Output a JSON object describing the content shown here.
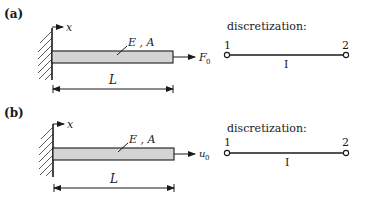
{
  "panels": [
    {
      "label": "(a)",
      "axis_label": "x",
      "material_label": "E , A",
      "length_label": "L",
      "load_symbol": "F",
      "load_subscript": "0",
      "discretization": {
        "title": "discretization:",
        "node_left": "1",
        "node_right": "2",
        "element_label": "I"
      }
    },
    {
      "label": "(b)",
      "axis_label": "x",
      "material_label": "E , A",
      "length_label": "L",
      "load_symbol": "u",
      "load_subscript": "0",
      "discretization": {
        "title": "discretization:",
        "node_left": "1",
        "node_right": "2",
        "element_label": "I"
      }
    }
  ],
  "colors": {
    "bar_fill": "#d4d4d4",
    "ink": "#1a1a1a"
  }
}
